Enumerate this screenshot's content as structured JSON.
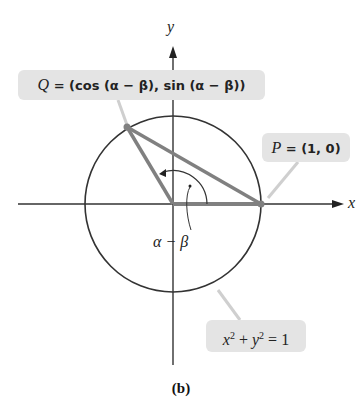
{
  "diagram": {
    "axes": {
      "x_label": "x",
      "y_label": "y"
    },
    "circle": {
      "equation_lhs_x": "x",
      "equation_lhs_y": "y",
      "exp": "2",
      "equation_rhs": " = 1",
      "plus": " + "
    },
    "points": {
      "Q": {
        "name": "Q",
        "coords": " = (cos (α − β), sin (α − β))"
      },
      "P": {
        "name": "P",
        "coords": " = (1, 0)"
      }
    },
    "angle_label": "α − β",
    "caption": "(b)",
    "colors": {
      "segment": "#808080",
      "circle": "#333333",
      "label_bg": "#e4e4e4",
      "leader": "#cccccc"
    }
  }
}
